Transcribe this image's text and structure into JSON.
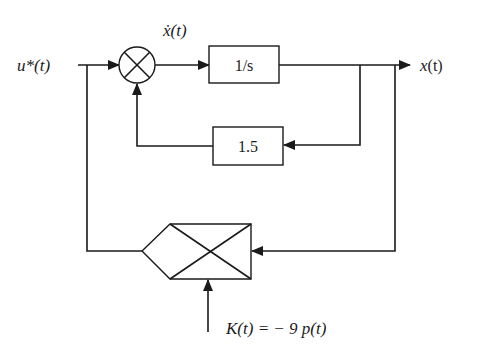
{
  "diagram": {
    "type": "block-diagram",
    "labels": {
      "input": "u*(t)",
      "derivative": "ẋ(t)",
      "output_var": "x",
      "output_paren": "(t)",
      "gain_expr": "K(t) = − 9 p(t)"
    },
    "blocks": [
      {
        "id": "integrator",
        "label": "1/s"
      },
      {
        "id": "feedback-gain",
        "label": "1.5"
      },
      {
        "id": "multiplier",
        "label": ""
      }
    ],
    "junctions": [
      {
        "id": "summing-junction",
        "symbol": "⊗"
      }
    ],
    "colors": {
      "line": "#1a1a1a",
      "background": "#ffffff"
    }
  }
}
